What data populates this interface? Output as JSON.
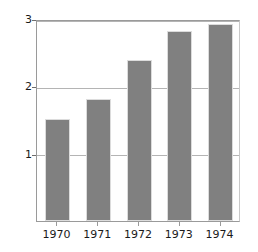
{
  "chart_data": {
    "type": "bar",
    "title": "",
    "subtitle": "",
    "xlabel": "",
    "ylabel": "Billions of pounds",
    "categories": [
      "1970",
      "1971",
      "1972",
      "1973",
      "1974"
    ],
    "values": [
      1.51,
      1.81,
      2.39,
      2.82,
      2.93
    ],
    "series": [
      {
        "name": "Billions of pounds",
        "values": [
          1.51,
          1.81,
          2.39,
          2.82,
          2.93
        ]
      }
    ],
    "ylim": [
      0,
      3
    ],
    "ytick_labels": [
      "1",
      "2",
      "3"
    ],
    "ytick_values": [
      1,
      2,
      3
    ],
    "grid": true,
    "grid_axis": "y",
    "legend": false,
    "legend_position": "none",
    "bar_color": "#808080",
    "bar_edge_color": "#dcdcdc",
    "gridline_color": "#b4b4b4",
    "axis_color": "#9a9a9a",
    "text_color": "#1a1a1a",
    "background_color": "#ffffff",
    "annotations": []
  }
}
